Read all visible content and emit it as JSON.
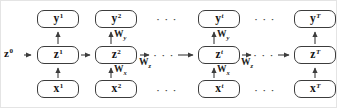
{
  "figure": {
    "type": "diagram",
    "colors": {
      "ink": "#3c3c3c",
      "text": "#141414",
      "background": "#ffffff"
    },
    "dots": "· · ·",
    "initial_state": {
      "base": "z",
      "sup": "0"
    },
    "columns": [
      {
        "id": "1",
        "y": {
          "base": "y",
          "sup": "1"
        },
        "z": {
          "base": "z",
          "sup": "1"
        },
        "x": {
          "base": "x",
          "sup": "1"
        }
      },
      {
        "id": "2",
        "y": {
          "base": "y",
          "sup": "2"
        },
        "z": {
          "base": "z",
          "sup": "2"
        },
        "x": {
          "base": "x",
          "sup": "2"
        },
        "weight_out": {
          "base": "W",
          "sub": "y"
        },
        "weight_in": {
          "base": "W",
          "sub": "x"
        },
        "weight_rec": {
          "base": "W",
          "sub": "z"
        }
      },
      {
        "id": "t",
        "y": {
          "base": "y",
          "sup": "t"
        },
        "z": {
          "base": "z",
          "sup": "t"
        },
        "x": {
          "base": "x",
          "sup": "t"
        },
        "weight_out": {
          "base": "W",
          "sub": "y"
        },
        "weight_in": {
          "base": "W",
          "sub": "x"
        },
        "weight_rec": {
          "base": "W",
          "sub": "z"
        }
      },
      {
        "id": "T",
        "y": {
          "base": "y",
          "sup": "T"
        },
        "z": {
          "base": "z",
          "sup": "T"
        },
        "x": {
          "base": "x",
          "sup": "T"
        }
      }
    ]
  }
}
